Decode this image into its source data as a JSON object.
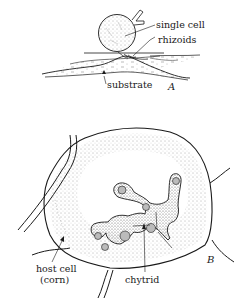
{
  "figure": {
    "panel_a": {
      "letter": "A",
      "labels": {
        "single_cell": "single cell",
        "rhizoids": "rhizoids",
        "substrate": "substrate"
      }
    },
    "panel_b": {
      "letter": "B",
      "labels": {
        "host_cell_line1": "host cell",
        "host_cell_line2": "(corn)",
        "chytrid": "chytrid"
      }
    },
    "colors": {
      "ink": "#1a1a1a",
      "background": "#ffffff",
      "stipple": "#555555"
    }
  }
}
